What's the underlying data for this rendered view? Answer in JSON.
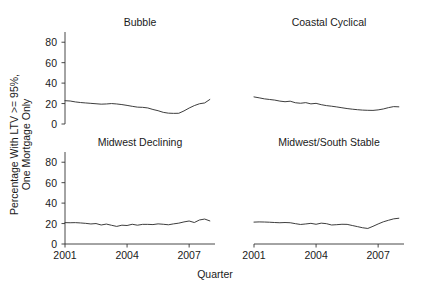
{
  "chart_data": {
    "type": "line",
    "title": "",
    "xlabel": "Quarter",
    "ylabel": "Percentage With LTV >= 95%,\nOne Mortgage Only",
    "layout": "2x2 trellis panels",
    "grid": false,
    "legend": "none",
    "line_color": "#333333",
    "xlim": [
      2001,
      2008.25
    ],
    "ylim": [
      0,
      90
    ],
    "yticks": [
      0,
      20,
      40,
      60,
      80
    ],
    "ytick_labels": [
      "0",
      "20",
      "40",
      "60",
      "80"
    ],
    "xticks": [
      2001,
      2004,
      2007
    ],
    "xtick_labels": [
      "2001",
      "2004",
      "2007"
    ],
    "x": [
      2001.0,
      2001.25,
      2001.5,
      2001.75,
      2002.0,
      2002.25,
      2002.5,
      2002.75,
      2003.0,
      2003.25,
      2003.5,
      2003.75,
      2004.0,
      2004.25,
      2004.5,
      2004.75,
      2005.0,
      2005.25,
      2005.5,
      2005.75,
      2006.0,
      2006.25,
      2006.5,
      2006.75,
      2007.0,
      2007.25,
      2007.5,
      2007.75,
      2008.0
    ],
    "panels": [
      {
        "title": "Bubble",
        "row": 0,
        "col": 0,
        "values": [
          22.8,
          22.5,
          21.6,
          21.0,
          20.6,
          20.2,
          19.8,
          19.4,
          19.6,
          20.0,
          19.6,
          19.0,
          18.2,
          17.3,
          16.5,
          16.3,
          15.7,
          14.2,
          13.0,
          11.4,
          10.6,
          10.4,
          10.5,
          12.8,
          15.6,
          18.0,
          19.8,
          20.6,
          24.0
        ]
      },
      {
        "title": "Coastal Cyclical",
        "row": 0,
        "col": 1,
        "values": [
          26.5,
          25.6,
          24.6,
          24.0,
          23.4,
          22.4,
          21.8,
          22.3,
          20.8,
          20.3,
          20.9,
          19.7,
          20.2,
          18.9,
          18.0,
          17.4,
          16.7,
          15.9,
          15.1,
          14.5,
          14.0,
          13.6,
          13.4,
          13.3,
          13.8,
          14.7,
          16.0,
          17.0,
          16.8
        ]
      },
      {
        "title": "Midwest Declining",
        "row": 1,
        "col": 0,
        "values": [
          20.9,
          20.8,
          20.9,
          20.6,
          20.2,
          19.6,
          20.0,
          18.6,
          19.5,
          18.3,
          17.2,
          18.4,
          18.1,
          19.3,
          18.4,
          19.2,
          19.2,
          19.0,
          19.7,
          19.3,
          18.8,
          19.7,
          20.4,
          21.6,
          22.5,
          21.0,
          23.5,
          24.4,
          22.6
        ]
      },
      {
        "title": "Midwest/South Stable",
        "row": 1,
        "col": 1,
        "values": [
          21.4,
          21.6,
          21.5,
          21.3,
          21.0,
          20.8,
          21.0,
          20.8,
          19.9,
          19.1,
          19.6,
          20.2,
          19.3,
          20.4,
          19.9,
          18.6,
          18.9,
          19.3,
          19.2,
          18.1,
          17.0,
          15.9,
          15.2,
          17.3,
          19.6,
          21.7,
          23.2,
          24.6,
          25.2
        ]
      }
    ]
  }
}
